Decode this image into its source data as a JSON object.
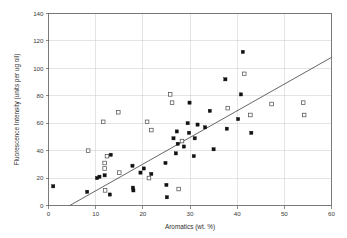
{
  "chart_data": {
    "type": "scatter",
    "title": "",
    "xlabel": "Aromatics (wt. %)",
    "ylabel": "Fluorescence Intensity (units per ug oil)",
    "xlim": [
      0,
      60
    ],
    "ylim": [
      0,
      140
    ],
    "xticks": [
      0,
      10,
      20,
      30,
      40,
      50,
      60
    ],
    "yticks": [
      0,
      20,
      40,
      60,
      80,
      100,
      120,
      140
    ],
    "xtick_labels": [
      "0",
      "10",
      "20",
      "30",
      "40",
      "50",
      "60"
    ],
    "ytick_labels": [
      "0",
      "20",
      "40",
      "60",
      "80",
      "100",
      "120",
      "140"
    ],
    "grid": true,
    "grid_axes": "both",
    "legend": false,
    "legend_position": "none",
    "marker_colors": {
      "filled_square": "#111111",
      "open_square": "#ffffff",
      "open_square_edge": "#4a4a4a",
      "trend_line": "#555555",
      "grid": "#c9c9c9",
      "frame": "#5a5a5a",
      "background": "#ffffff"
    },
    "series": [
      {
        "name": "filled-square-series",
        "marker": "filled square",
        "points": [
          [
            1.0,
            14
          ],
          [
            8.2,
            10
          ],
          [
            10.3,
            20
          ],
          [
            10.8,
            21
          ],
          [
            11.9,
            22
          ],
          [
            13.0,
            8
          ],
          [
            13.2,
            37
          ],
          [
            17.8,
            29
          ],
          [
            17.9,
            13
          ],
          [
            18.0,
            11
          ],
          [
            19.5,
            24
          ],
          [
            20.2,
            27
          ],
          [
            21.8,
            23
          ],
          [
            24.8,
            31
          ],
          [
            25.0,
            15
          ],
          [
            25.1,
            6
          ],
          [
            26.5,
            49
          ],
          [
            27.0,
            38
          ],
          [
            27.2,
            54
          ],
          [
            27.4,
            45
          ],
          [
            28.7,
            43
          ],
          [
            29.5,
            60
          ],
          [
            29.8,
            53
          ],
          [
            29.9,
            75
          ],
          [
            30.8,
            36
          ],
          [
            31.0,
            49
          ],
          [
            31.6,
            59
          ],
          [
            33.2,
            57
          ],
          [
            34.2,
            69
          ],
          [
            35.0,
            41
          ],
          [
            37.5,
            92
          ],
          [
            37.8,
            56
          ],
          [
            40.2,
            63
          ],
          [
            40.8,
            81
          ],
          [
            41.2,
            112
          ],
          [
            43.0,
            53
          ]
        ]
      },
      {
        "name": "open-square-series",
        "marker": "open square",
        "points": [
          [
            8.4,
            40
          ],
          [
            11.6,
            61
          ],
          [
            11.9,
            31
          ],
          [
            11.9,
            27
          ],
          [
            12.0,
            11
          ],
          [
            12.4,
            36
          ],
          [
            14.8,
            68
          ],
          [
            15.0,
            24
          ],
          [
            20.9,
            61
          ],
          [
            21.3,
            20
          ],
          [
            21.8,
            55
          ],
          [
            25.8,
            81
          ],
          [
            26.2,
            75
          ],
          [
            27.6,
            12
          ],
          [
            28.3,
            47
          ],
          [
            38.0,
            71
          ],
          [
            41.5,
            96
          ],
          [
            42.8,
            66
          ],
          [
            47.3,
            74
          ],
          [
            54.0,
            75
          ],
          [
            54.2,
            66
          ]
        ]
      }
    ],
    "trend_line": {
      "name": "regression-line",
      "x_start": 4.5,
      "y_start": 0,
      "x_end": 60.0,
      "y_end": 108
    }
  }
}
